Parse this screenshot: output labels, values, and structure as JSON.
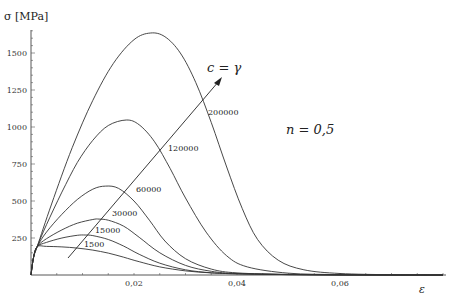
{
  "chart_data": {
    "type": "line",
    "title": "",
    "xlabel": "ε",
    "ylabel": "σ [MPa]",
    "xlim": [
      0,
      0.08
    ],
    "ylim": [
      0,
      1700
    ],
    "grid": false,
    "legend": "none (inline curve labels)",
    "x_ticks": [
      0.02,
      0.04,
      0.06
    ],
    "x_tick_labels": [
      "0,02",
      "0,04",
      "0,06"
    ],
    "x_minor_step": 0.005,
    "y_ticks": [
      250,
      500,
      750,
      1000,
      1250,
      1500
    ],
    "y_tick_labels": [
      "250",
      "500",
      "750",
      "1000",
      "1250",
      "1500"
    ],
    "y_minor_step": 50,
    "annotations": [
      {
        "text": "c = γ",
        "note": "arrow pointing toward increasing c"
      },
      {
        "text": "n = 0,5"
      }
    ],
    "series": [
      {
        "name": "1500",
        "label": "1500",
        "x": [
          0,
          0.0005,
          0.0012,
          0.003,
          0.006,
          0.009,
          0.012,
          0.015,
          0.018,
          0.021,
          0.025,
          0.03,
          0.035,
          0.04,
          0.05,
          0.06,
          0.07,
          0.08
        ],
        "y": [
          0,
          120,
          192,
          193,
          190,
          182,
          168,
          148,
          120,
          90,
          55,
          28,
          14,
          8,
          3,
          1,
          0,
          0
        ]
      },
      {
        "name": "15000",
        "label": "15000",
        "x": [
          0,
          0.0005,
          0.0012,
          0.003,
          0.006,
          0.009,
          0.0105,
          0.012,
          0.015,
          0.018,
          0.021,
          0.025,
          0.03,
          0.035,
          0.04,
          0.05,
          0.06,
          0.07,
          0.08
        ],
        "y": [
          0,
          120,
          192,
          220,
          250,
          268,
          270,
          266,
          240,
          195,
          140,
          80,
          35,
          15,
          8,
          3,
          1,
          0,
          0
        ]
      },
      {
        "name": "30000",
        "label": "30000",
        "x": [
          0,
          0.0005,
          0.0012,
          0.003,
          0.006,
          0.009,
          0.012,
          0.0132,
          0.015,
          0.018,
          0.021,
          0.025,
          0.03,
          0.035,
          0.04,
          0.05,
          0.06,
          0.07,
          0.08
        ],
        "y": [
          0,
          120,
          192,
          245,
          305,
          350,
          375,
          378,
          370,
          330,
          255,
          150,
          65,
          25,
          10,
          3,
          1,
          0,
          0
        ]
      },
      {
        "name": "60000",
        "label": "60000",
        "x": [
          0,
          0.0005,
          0.0012,
          0.003,
          0.006,
          0.009,
          0.012,
          0.0145,
          0.017,
          0.02,
          0.023,
          0.026,
          0.03,
          0.035,
          0.04,
          0.05,
          0.06,
          0.07,
          0.08
        ],
        "y": [
          0,
          120,
          192,
          290,
          410,
          510,
          580,
          601,
          585,
          500,
          370,
          230,
          110,
          40,
          14,
          4,
          1,
          0,
          0
        ]
      },
      {
        "name": "120000",
        "label": "120000",
        "x": [
          0,
          0.0005,
          0.0012,
          0.003,
          0.006,
          0.009,
          0.012,
          0.015,
          0.0185,
          0.021,
          0.024,
          0.027,
          0.03,
          0.034,
          0.038,
          0.042,
          0.05,
          0.06,
          0.07,
          0.08
        ],
        "y": [
          0,
          120,
          192,
          340,
          560,
          760,
          910,
          1010,
          1047,
          1015,
          900,
          720,
          520,
          290,
          130,
          55,
          12,
          3,
          1,
          0
        ]
      },
      {
        "name": "200000",
        "label": "200000",
        "x": [
          0,
          0.0005,
          0.0012,
          0.004,
          0.008,
          0.012,
          0.016,
          0.02,
          0.0232,
          0.026,
          0.029,
          0.032,
          0.035,
          0.038,
          0.041,
          0.044,
          0.048,
          0.053,
          0.06,
          0.07,
          0.08
        ],
        "y": [
          0,
          120,
          192,
          480,
          860,
          1180,
          1430,
          1590,
          1635,
          1610,
          1500,
          1300,
          1030,
          730,
          450,
          240,
          100,
          35,
          10,
          2,
          0
        ]
      }
    ]
  },
  "labels": {
    "y_axis_title": "σ [MPa]",
    "x_axis_title": "ε",
    "arrow_label": "c = γ",
    "n_label": "n = 0,5"
  }
}
